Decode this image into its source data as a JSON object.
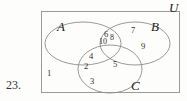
{
  "figure": {
    "kind": "venn-diagram-three-set",
    "problem_number": "23.",
    "universe_label": "U",
    "sets": [
      {
        "id": "A",
        "label": "A"
      },
      {
        "id": "B",
        "label": "B"
      },
      {
        "id": "C",
        "label": "C"
      }
    ],
    "regions": [
      {
        "id": "outside",
        "description": "inside U, outside A, B and C",
        "value": "1"
      },
      {
        "id": "C-only",
        "description": "C only",
        "value": "3"
      },
      {
        "id": "A-and-C-low",
        "description": "A intersect C",
        "value": "2"
      },
      {
        "id": "A-and-C-high",
        "description": "A intersect C",
        "value": "4"
      },
      {
        "id": "B-and-C",
        "description": "B intersect C",
        "value": "5"
      },
      {
        "id": "A-and-B-top",
        "description": "A intersect B",
        "value": "6"
      },
      {
        "id": "A-and-B-low",
        "description": "A intersect B",
        "value": "10"
      },
      {
        "id": "center",
        "description": "A intersect B intersect C",
        "value": "8"
      },
      {
        "id": "B-only-top",
        "description": "B only",
        "value": "7"
      },
      {
        "id": "B-only-right",
        "description": "B only",
        "value": "9"
      }
    ],
    "colors": {
      "stroke": "#8d8d8d",
      "box_stroke": "#9a9a9a",
      "text": "#2b2b2b",
      "background": "#fdfdfc"
    }
  }
}
